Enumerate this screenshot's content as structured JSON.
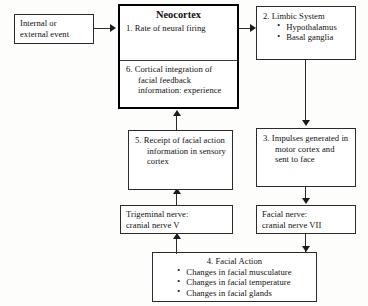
{
  "diagram": {
    "nodes": {
      "event": {
        "lines": [
          "Internal or",
          "external event"
        ]
      },
      "neocortex": {
        "heading": "Neocortex",
        "item1": "1. Rate of neural firing",
        "item6": "6. Cortical integration of facial feedback information: experience"
      },
      "limbic": {
        "heading": "2. Limbic System",
        "bullets": [
          "Hypothalamus",
          "Basal ganglia"
        ]
      },
      "impulses": {
        "text": "3. Impulses generated in motor cortex and sent to face"
      },
      "facial_nerve": {
        "line1": "Facial nerve:",
        "line2": "cranial nerve VII"
      },
      "facial_action": {
        "heading": "4. Facial Action",
        "bullets": [
          "Changes in facial musculature",
          "Changes in facial temperature",
          "Changes in facial glands"
        ]
      },
      "trigeminal": {
        "line1": "Trigeminal nerve:",
        "line2": "cranial nerve V"
      },
      "receipt": {
        "text": "5. Receipt of facial action information in sensory cortex"
      }
    },
    "connectors": [
      {
        "name": "event-to-neocortex",
        "direction": "right"
      },
      {
        "name": "neocortex-to-limbic",
        "direction": "right"
      },
      {
        "name": "limbic-to-impulses",
        "direction": "down"
      },
      {
        "name": "impulses-to-facial-nerve",
        "direction": "down"
      },
      {
        "name": "facial-nerve-to-facial-action",
        "direction": "down"
      },
      {
        "name": "facial-action-to-trigeminal",
        "direction": "up"
      },
      {
        "name": "trigeminal-to-receipt",
        "direction": "up"
      },
      {
        "name": "receipt-to-neocortex",
        "direction": "up"
      }
    ],
    "colors": {
      "stroke": "#2b2b2b",
      "thick_stroke": "#000000",
      "background": "#fdfdfb",
      "box_fill": "#ffffff",
      "text": "#111111"
    }
  }
}
